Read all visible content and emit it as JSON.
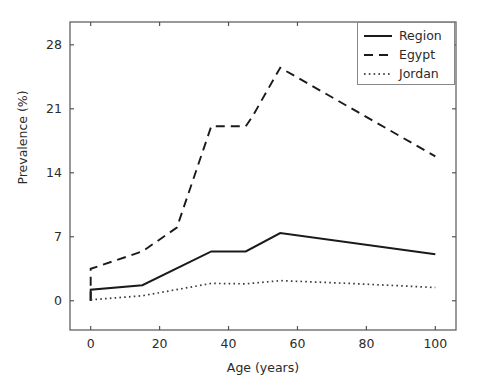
{
  "chart_data": {
    "type": "line",
    "title": "",
    "xlabel": "Age (years)",
    "ylabel": "Prevalence (%)",
    "xlim": [
      -6,
      106
    ],
    "ylim": [
      -3.2,
      30.5
    ],
    "xticks": [
      "0",
      "20",
      "40",
      "60",
      "80",
      "100"
    ],
    "xtick_values": [
      0,
      20,
      40,
      60,
      80,
      100
    ],
    "yticks": [
      "0",
      "7",
      "14",
      "21",
      "28"
    ],
    "ytick_values": [
      0,
      7,
      14,
      21,
      28
    ],
    "grid": false,
    "legend_position": "upper right",
    "series": [
      {
        "name": "Region",
        "style": "solid",
        "color": "#1a1a1a",
        "x": [
          0,
          0,
          15,
          35,
          45,
          55,
          100
        ],
        "values": [
          0.0,
          1.2,
          1.7,
          5.4,
          5.4,
          7.4,
          5.1
        ]
      },
      {
        "name": "Egypt",
        "style": "dashed",
        "color": "#1a1a1a",
        "x": [
          0,
          0,
          15,
          25,
          35,
          45,
          47,
          55,
          100
        ],
        "values": [
          0.0,
          3.5,
          5.4,
          8.0,
          19.1,
          19.1,
          20.2,
          25.5,
          15.8
        ]
      },
      {
        "name": "Jordan",
        "style": "dotted",
        "color": "#3a3a3a",
        "x": [
          0,
          15,
          35,
          45,
          55,
          75,
          100
        ],
        "values": [
          0.1,
          0.55,
          1.9,
          1.85,
          2.2,
          1.9,
          1.45
        ]
      }
    ]
  },
  "legend": {
    "entries": [
      {
        "label": "Region",
        "style": "solid"
      },
      {
        "label": "Egypt",
        "style": "dashed"
      },
      {
        "label": "Jordan",
        "style": "dotted"
      }
    ]
  }
}
